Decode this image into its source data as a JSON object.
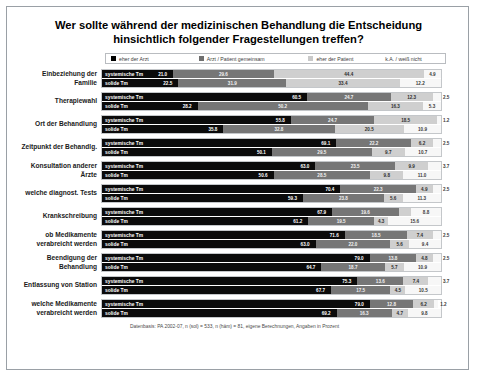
{
  "title": "Wer sollte während der medizinischen Behandlung die Entscheidung hinsichtlich folgender Fragestellungen treffen?",
  "legend": [
    {
      "label": "eher der Arzt",
      "color": "#0b0b0b"
    },
    {
      "label": "Arzt / Patient gemeinsam",
      "color": "#767676"
    },
    {
      "label": "eher der Patient",
      "color": "#cfcfcf"
    },
    {
      "label": "k.A. / weiß nicht",
      "color": "#f7f7f7"
    }
  ],
  "series_names": {
    "systemic": "systemische Tm",
    "solid": "solide Tm"
  },
  "footer": "Datenbasis: PA 2002-07, n (sol) = 533, n (häm) = 81, eigene Berechnungen, Angaben in Prozent",
  "chart_data": {
    "type": "bar",
    "orientation": "horizontal",
    "stacked": true,
    "units": "percent",
    "xlim": [
      0,
      100
    ],
    "grid": false,
    "legend_position": "top",
    "title": "Wer sollte während der medizinischen Behandlung die Entscheidung hinsichtlich folgender Fragestellungen treffen?",
    "xlabel": "",
    "ylabel": "",
    "legend_entries": [
      "eher der Arzt",
      "Arzt / Patient gemeinsam",
      "eher der Patient",
      "k.A. / weiß nicht"
    ],
    "categories": [
      "Einbeziehung der Familie",
      "Therapiewahl",
      "Ort der Behandlung",
      "Zeitpunkt der Behandlg.",
      "Konsultation anderer Ärzte",
      "welche diagnost. Tests",
      "Krankschreibung",
      "ob Medikamente verabreicht werden",
      "Beendigung der Behandlung",
      "Entlassung von Station",
      "welche Medikamente verabreicht werden"
    ],
    "groups": [
      {
        "category": "Einbeziehung der Familie",
        "rows": [
          {
            "series": "systemische Tm",
            "values": [
              21.0,
              29.6,
              44.4,
              4.9
            ]
          },
          {
            "series": "solide Tm",
            "values": [
              22.5,
              31.9,
              33.4,
              12.2
            ]
          }
        ]
      },
      {
        "category": "Therapiewahl",
        "rows": [
          {
            "series": "systemische Tm",
            "values": [
              60.5,
              24.7,
              12.3,
              2.5
            ]
          },
          {
            "series": "solide Tm",
            "values": [
              28.2,
              50.2,
              16.3,
              5.3
            ]
          }
        ]
      },
      {
        "category": "Ort der Behandlung",
        "rows": [
          {
            "series": "systemische Tm",
            "values": [
              55.8,
              24.7,
              18.5,
              1.2
            ]
          },
          {
            "series": "solide Tm",
            "values": [
              35.8,
              32.8,
              20.5,
              10.9
            ]
          }
        ]
      },
      {
        "category": "Zeitpunkt der Behandlg.",
        "rows": [
          {
            "series": "systemische Tm",
            "values": [
              69.1,
              22.2,
              6.2,
              2.5
            ]
          },
          {
            "series": "solide Tm",
            "values": [
              50.1,
              29.5,
              9.7,
              10.7
            ]
          }
        ]
      },
      {
        "category": "Konsultation anderer Ärzte",
        "rows": [
          {
            "series": "systemische Tm",
            "values": [
              63.0,
              23.5,
              9.9,
              3.7
            ]
          },
          {
            "series": "solide Tm",
            "values": [
              50.6,
              28.5,
              9.8,
              11.0
            ]
          }
        ]
      },
      {
        "category": "welche diagnost. Tests",
        "rows": [
          {
            "series": "systemische Tm",
            "values": [
              70.4,
              22.3,
              4.9,
              2.5
            ]
          },
          {
            "series": "solide Tm",
            "values": [
              59.3,
              23.8,
              5.6,
              11.3
            ]
          }
        ]
      },
      {
        "category": "Krankschreibung",
        "rows": [
          {
            "series": "systemische Tm",
            "values": [
              67.9,
              19.6,
              3.7,
              8.8
            ]
          },
          {
            "series": "solide Tm",
            "values": [
              61.2,
              19.5,
              4.3,
              15.6
            ]
          }
        ]
      },
      {
        "category": "ob Medikamente verabreicht werden",
        "rows": [
          {
            "series": "systemische Tm",
            "values": [
              71.6,
              18.5,
              7.4,
              2.5
            ]
          },
          {
            "series": "solide Tm",
            "values": [
              63.0,
              22.0,
              5.6,
              9.4
            ]
          }
        ]
      },
      {
        "category": "Beendigung der Behandlung",
        "rows": [
          {
            "series": "systemische Tm",
            "values": [
              79.0,
              13.8,
              4.8,
              2.5
            ]
          },
          {
            "series": "solide Tm",
            "values": [
              64.7,
              18.7,
              5.7,
              10.9
            ]
          }
        ]
      },
      {
        "category": "Entlassung von Station",
        "rows": [
          {
            "series": "systemische Tm",
            "values": [
              75.3,
              13.6,
              7.4,
              3.7
            ]
          },
          {
            "series": "solide Tm",
            "values": [
              67.7,
              17.5,
              4.5,
              10.5
            ]
          }
        ]
      },
      {
        "category": "welche Medikamente verabreicht werden",
        "rows": [
          {
            "series": "systemische Tm",
            "values": [
              79.0,
              12.8,
              6.2,
              1.2
            ]
          },
          {
            "series": "solide Tm",
            "values": [
              69.2,
              16.3,
              4.7,
              9.8
            ]
          }
        ]
      }
    ]
  }
}
